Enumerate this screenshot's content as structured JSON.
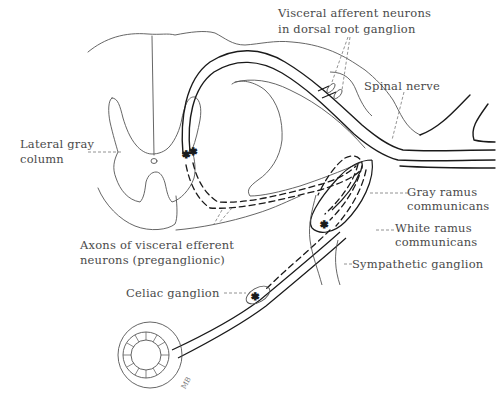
{
  "figure": {
    "type": "anatomical line drawing"
  },
  "labels": {
    "visceral_afferent_line1": "Visceral afferent neurons",
    "visceral_afferent_line2": "in dorsal root ganglion",
    "spinal_nerve": "Spinal nerve",
    "lateral_gray_line1": "Lateral gray",
    "lateral_gray_line2": "column",
    "gray_ramus_line1": "Gray ramus",
    "gray_ramus_line2": "communicans",
    "white_ramus_line1": "White ramus",
    "white_ramus_line2": "communicans",
    "sympathetic_ganglion": "Sympathetic ganglion",
    "axons_line1": "Axons of visceral efferent",
    "axons_line2": "neurons (preganglionic)",
    "celiac_ganglion": "Celiac ganglion",
    "signature": "MB"
  },
  "colors": {
    "line": "#1a1a1a",
    "thin_line": "#555555",
    "leader": "#777777",
    "text": "#4a4a4a",
    "background": "#ffffff"
  }
}
